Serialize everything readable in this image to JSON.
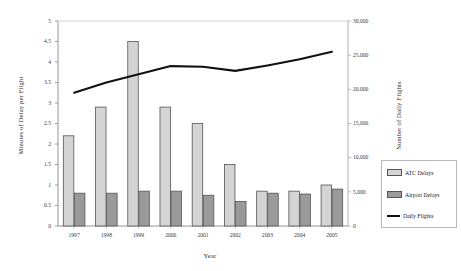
{
  "chart_data": {
    "type": "bar",
    "title": "",
    "xlabel": "Year",
    "ylabel": "Minutes of Delay per Flight",
    "y2label": "Number of Daily Flights",
    "categories": [
      "1997",
      "1998",
      "1999",
      "2000",
      "2001",
      "2002",
      "2003",
      "2004",
      "2005"
    ],
    "ylim": [
      0,
      5
    ],
    "y2lim": [
      0,
      30000
    ],
    "ytick_labels": [
      "0",
      "0.5",
      "1",
      "1.5",
      "2",
      "2.5",
      "3",
      "3.5",
      "4",
      "4.5",
      "5"
    ],
    "ytick_values": [
      0,
      0.5,
      1,
      1.5,
      2,
      2.5,
      3,
      3.5,
      4,
      4.5,
      5
    ],
    "y2tick_labels": [
      "0",
      "5,000",
      "10,000",
      "15,000",
      "20,000",
      "25,000",
      "30,000"
    ],
    "y2tick_values": [
      0,
      5000,
      10000,
      15000,
      20000,
      25000,
      30000
    ],
    "grid": false,
    "legend_position": "right",
    "series": [
      {
        "name": "ATC Delays",
        "type": "bar",
        "axis": "left",
        "color": "#d4d4d4",
        "edge_color": "#555555",
        "values": [
          2.2,
          2.9,
          4.5,
          2.9,
          2.5,
          1.5,
          0.85,
          0.85,
          1.0
        ]
      },
      {
        "name": "Airport Delays",
        "type": "bar",
        "axis": "left",
        "color": "#9a9a9a",
        "edge_color": "#555555",
        "values": [
          0.8,
          0.8,
          0.85,
          0.85,
          0.75,
          0.6,
          0.8,
          0.78,
          0.9
        ]
      },
      {
        "name": "Daily Flights",
        "type": "line",
        "axis": "right",
        "color": "#111111",
        "values": [
          19500,
          21000,
          22200,
          23400,
          23300,
          22700,
          23500,
          24400,
          25500
        ]
      }
    ]
  },
  "legend": {
    "items": [
      {
        "label": "ATC Delays",
        "swatch": "bar-light"
      },
      {
        "label": "Airport Delays",
        "swatch": "bar-dark"
      },
      {
        "label": "Daily Flights",
        "swatch": "line-black"
      }
    ]
  }
}
